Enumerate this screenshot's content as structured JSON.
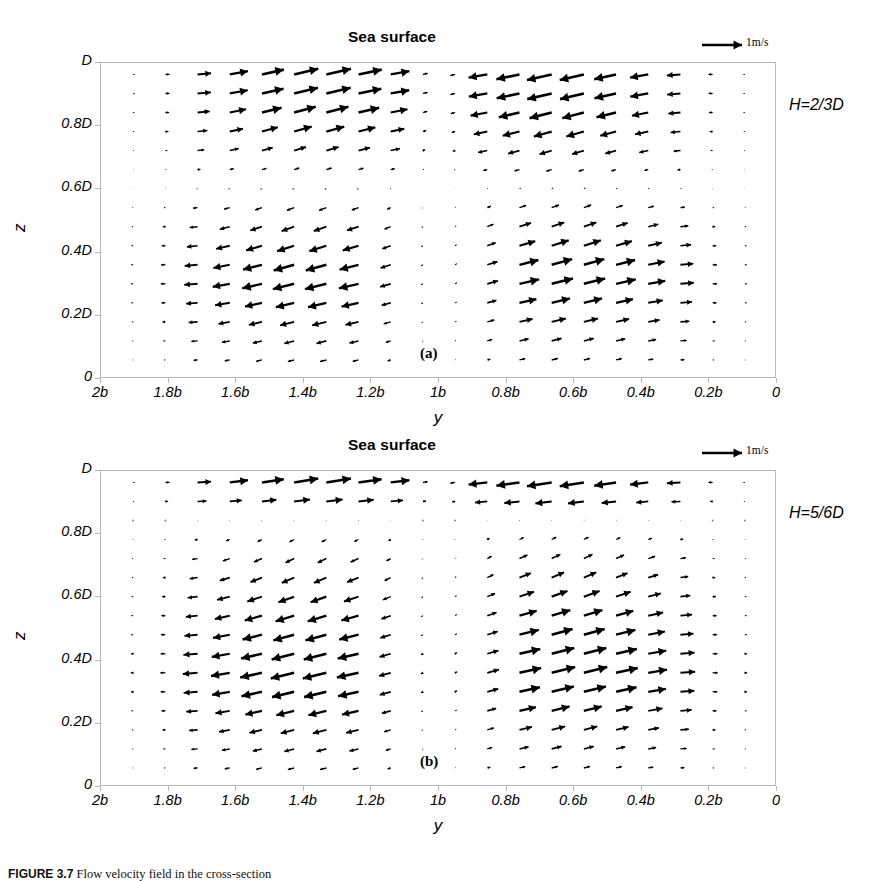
{
  "figure": {
    "caption_prefix": "FIGURE 3.7",
    "caption_text": " Flow velocity field in the cross-section",
    "scale_legend_label": "1m/s",
    "scale_legend_icon": "arrow-right-icon"
  },
  "panels": [
    {
      "id": "a",
      "letter": "(a)",
      "title": "Sea surface",
      "case_label": "H=2/3D",
      "xlabel": "y",
      "ylabel": "z",
      "xticks": [
        "2b",
        "1.8b",
        "1.6b",
        "1.4b",
        "1.2b",
        "1b",
        "0.8b",
        "0.6b",
        "0.4b",
        "0.2b",
        "0"
      ],
      "yticks": [
        "D",
        "0.8D",
        "0.6D",
        "0.4D",
        "0.2D",
        "0"
      ]
    },
    {
      "id": "b",
      "letter": "(b)",
      "title": "Sea surface",
      "case_label": "H=5/6D",
      "xlabel": "y",
      "ylabel": "z",
      "xticks": [
        "2b",
        "1.8b",
        "1.6b",
        "1.4b",
        "1.2b",
        "1b",
        "0.8b",
        "0.6b",
        "0.4b",
        "0.2b",
        "0"
      ],
      "yticks": [
        "D",
        "0.8D",
        "0.6D",
        "0.4D",
        "0.2D",
        "0"
      ]
    }
  ],
  "chart_data": [
    {
      "type": "quiver",
      "panel": "a",
      "title": "Sea surface",
      "xlabel": "y",
      "ylabel": "z",
      "annotation": "H=2/3D",
      "xlim": [
        2,
        0
      ],
      "ylim": [
        0,
        1
      ],
      "xtick_values": [
        2,
        1.8,
        1.6,
        1.4,
        1.2,
        1.0,
        0.8,
        0.6,
        0.4,
        0.2,
        0
      ],
      "xtick_labels": [
        "2b",
        "1.8b",
        "1.6b",
        "1.4b",
        "1.2b",
        "1b",
        "0.8b",
        "0.6b",
        "0.4b",
        "0.2b",
        "0"
      ],
      "ytick_values": [
        1.0,
        0.8,
        0.6,
        0.4,
        0.2,
        0
      ],
      "ytick_labels": [
        "D",
        "0.8D",
        "0.6D",
        "0.4D",
        "0.2D",
        "0"
      ],
      "grid": false,
      "legend": "1m/s",
      "legend_position": "top-right",
      "vector_scale_unit_mps": 1,
      "ncols": 20,
      "nrows": 16,
      "reversal_depth_fraction": 0.62,
      "surface_jet_sign": 1,
      "description": "Two counter-rotating circulation cells symmetric about y=1b; surface layer flows toward the centre, lower layer flows outward toward the banks."
    },
    {
      "type": "quiver",
      "panel": "b",
      "title": "Sea surface",
      "xlabel": "y",
      "ylabel": "z",
      "annotation": "H=5/6D",
      "xlim": [
        2,
        0
      ],
      "ylim": [
        0,
        1
      ],
      "xtick_values": [
        2,
        1.8,
        1.6,
        1.4,
        1.2,
        1.0,
        0.8,
        0.6,
        0.4,
        0.2,
        0
      ],
      "xtick_labels": [
        "2b",
        "1.8b",
        "1.6b",
        "1.4b",
        "1.2b",
        "1b",
        "0.8b",
        "0.6b",
        "0.4b",
        "0.2b",
        "0"
      ],
      "ytick_values": [
        1.0,
        0.8,
        0.6,
        0.4,
        0.2,
        0
      ],
      "ytick_labels": [
        "D",
        "0.8D",
        "0.6D",
        "0.4D",
        "0.2D",
        "0"
      ],
      "grid": false,
      "legend": "1m/s",
      "legend_position": "top-right",
      "vector_scale_unit_mps": 1,
      "ncols": 20,
      "nrows": 16,
      "reversal_depth_fraction": 0.86,
      "surface_jet_sign": 1,
      "description": "Same cross-section with a thinner surface inflow layer; the return flow occupies most of the water column."
    }
  ]
}
